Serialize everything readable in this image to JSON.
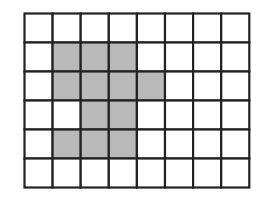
{
  "diagram": {
    "type": "grid-shape",
    "columns": 8,
    "rows": 6,
    "cell_color": "#ffffff",
    "shade_color": "#b9b9b9",
    "line_color": "#222222",
    "shaded_cells": [
      [
        1,
        1
      ],
      [
        1,
        2
      ],
      [
        1,
        3
      ],
      [
        2,
        1
      ],
      [
        2,
        2
      ],
      [
        2,
        3
      ],
      [
        2,
        4
      ],
      [
        3,
        2
      ],
      [
        3,
        3
      ],
      [
        4,
        1
      ],
      [
        4,
        2
      ],
      [
        4,
        3
      ]
    ]
  }
}
